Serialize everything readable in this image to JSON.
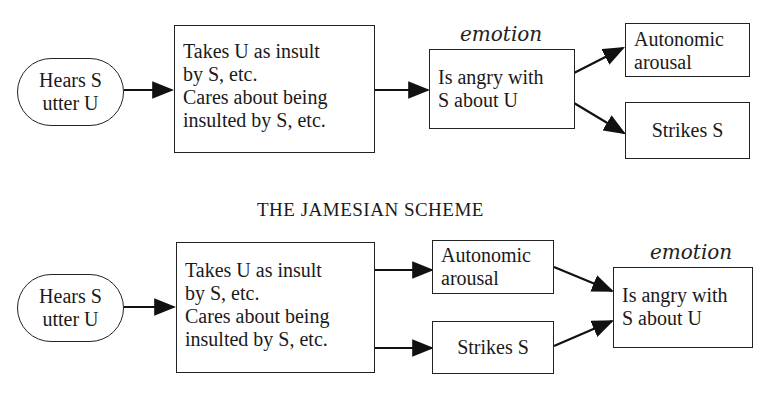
{
  "top_scheme": {
    "title_clipped": "THE COGNITIVE SCHEME",
    "annotation": "emotion",
    "nodes": {
      "hears": [
        "Hears S",
        "utter U"
      ],
      "takes": [
        "Takes U as insult",
        "by S, etc.",
        "Cares about being",
        "insulted by S, etc."
      ],
      "angry": [
        "Is angry with",
        "S about U"
      ],
      "arousal": [
        "Autonomic",
        "arousal"
      ],
      "strikes": "Strikes S"
    }
  },
  "bottom_scheme": {
    "title": "THE JAMESIAN SCHEME",
    "annotation": "emotion",
    "nodes": {
      "hears": [
        "Hears S",
        "utter U"
      ],
      "takes": [
        "Takes U as insult",
        "by S, etc.",
        "Cares about being",
        "insulted by S, etc."
      ],
      "arousal": [
        "Autonomic",
        "arousal"
      ],
      "strikes": "Strikes S",
      "angry": [
        "Is angry with",
        "S about U"
      ]
    }
  }
}
